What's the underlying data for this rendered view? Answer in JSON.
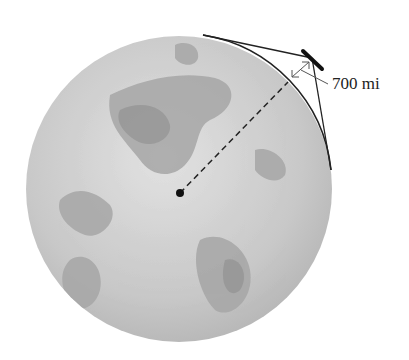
{
  "figure": {
    "altitude_label": "700 mi",
    "colors": {
      "globe_light": "#d6d6d6",
      "globe_land": "#a8a8a8",
      "globe_dark": "#8e8e8e",
      "line": "#222222"
    }
  }
}
